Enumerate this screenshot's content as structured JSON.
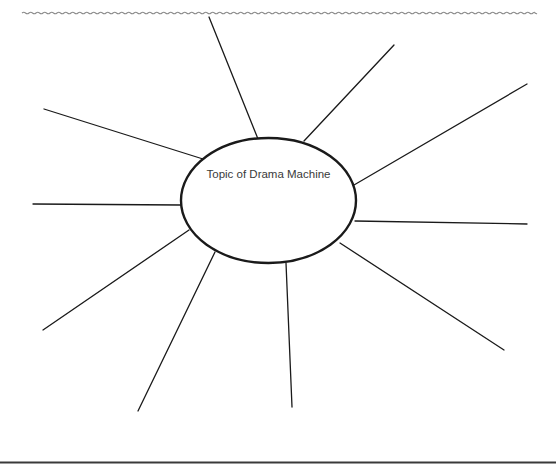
{
  "worksheet": {
    "header_divider": "wavy-line",
    "footer_divider": "solid-line"
  },
  "web": {
    "center_topic": "Topic of Drama Machine",
    "center_ellipse": {
      "cx": 268.5,
      "cy": 200.5,
      "rx": 87.5,
      "ry": 62.5
    },
    "spoke_count": 10,
    "spokes": [
      {
        "id": 1,
        "from": [
          258,
          139
        ],
        "to": [
          209,
          17
        ]
      },
      {
        "id": 2,
        "from": [
          304,
          141
        ],
        "to": [
          394,
          45
        ]
      },
      {
        "id": 3,
        "from": [
          354,
          185
        ],
        "to": [
          527,
          84
        ]
      },
      {
        "id": 4,
        "from": [
          355,
          221
        ],
        "to": [
          527,
          224
        ]
      },
      {
        "id": 5,
        "from": [
          340,
          243
        ],
        "to": [
          504,
          350
        ]
      },
      {
        "id": 6,
        "from": [
          286,
          263
        ],
        "to": [
          292,
          407
        ]
      },
      {
        "id": 7,
        "from": [
          215,
          252
        ],
        "to": [
          138,
          411
        ]
      },
      {
        "id": 8,
        "from": [
          189,
          230
        ],
        "to": [
          43,
          330
        ]
      },
      {
        "id": 9,
        "from": [
          181,
          205
        ],
        "to": [
          33,
          204
        ]
      },
      {
        "id": 10,
        "from": [
          203,
          159
        ],
        "to": [
          44,
          109
        ]
      }
    ]
  },
  "colors": {
    "line": "#1a1a1a",
    "wavy_line": "#8a8a8a",
    "text": "#3a3a3a",
    "background": "#ffffff"
  }
}
